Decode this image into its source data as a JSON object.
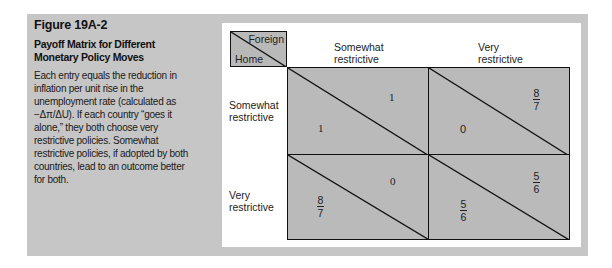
{
  "figure": {
    "number": "Figure 19A-2",
    "title": "Payoff Matrix for Different Monetary Policy Moves",
    "description": "Each entry equals the reduction in inflation per unit rise in the unemployment rate (calculated as −Δπ/ΔU). If each country “goes it alone,” they both choose very restrictive policies. Somewhat restrictive policies, if adopted by both countries, lead to an outcome better for both."
  },
  "matrix": {
    "corner": {
      "column_player": "Foreign",
      "row_player": "Home"
    },
    "columns": [
      "Somewhat restrictive",
      "Very restrictive"
    ],
    "columns_split": [
      [
        "Somewhat",
        "restrictive"
      ],
      [
        "Very",
        "restrictive"
      ]
    ],
    "rows": [
      "Somewhat restrictive",
      "Very restrictive"
    ],
    "rows_split": [
      [
        "Somewhat",
        "restrictive"
      ],
      [
        "Very",
        "restrictive"
      ]
    ],
    "cells": [
      [
        {
          "home": "1",
          "foreign": "1"
        },
        {
          "home": "0",
          "foreign": {
            "num": "8",
            "den": "7"
          }
        }
      ],
      [
        {
          "home": {
            "num": "8",
            "den": "7"
          },
          "foreign": "0"
        },
        {
          "home": {
            "num": "5",
            "den": "6"
          },
          "foreign": {
            "num": "5",
            "den": "6"
          }
        }
      ]
    ]
  },
  "colors": {
    "panel": "#c6c6c6",
    "cell_fill": "#bababa",
    "lines": "#111111"
  }
}
